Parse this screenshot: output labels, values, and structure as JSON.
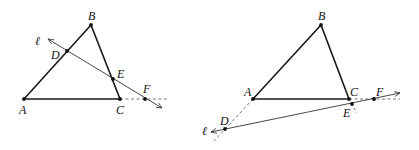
{
  "figures": [
    {
      "id": "left",
      "points": {
        "A": {
          "x": 24,
          "y": 99,
          "label": "A",
          "lx": 19,
          "ly": 114
        },
        "B": {
          "x": 91,
          "y": 25,
          "label": "B",
          "lx": 89,
          "ly": 20
        },
        "C": {
          "x": 120,
          "y": 99,
          "label": "C",
          "lx": 116,
          "ly": 114
        },
        "D": {
          "x": 67,
          "y": 51,
          "label": "D",
          "lx": 51,
          "ly": 59
        },
        "E": {
          "x": 113,
          "y": 79,
          "label": "E",
          "lx": 117,
          "ly": 78
        },
        "F": {
          "x": 145,
          "y": 99,
          "label": "F",
          "lx": 144,
          "ly": 93
        }
      },
      "line_label": {
        "text": "ℓ",
        "x": 36,
        "y": 45
      },
      "line_l": {
        "x1": 48,
        "y1": 39,
        "x2": 162,
        "y2": 108
      },
      "dashed": [
        {
          "x1": 120,
          "y1": 99,
          "x2": 167,
          "y2": 99
        }
      ]
    },
    {
      "id": "right",
      "points": {
        "A": {
          "x": 253,
          "y": 99,
          "label": "A",
          "lx": 245,
          "ly": 96
        },
        "B": {
          "x": 321,
          "y": 25,
          "label": "B",
          "lx": 319,
          "ly": 20
        },
        "C": {
          "x": 349,
          "y": 99,
          "label": "C",
          "lx": 350,
          "ly": 96
        },
        "D": {
          "x": 225,
          "y": 129,
          "label": "D",
          "lx": 220,
          "ly": 125
        },
        "E": {
          "x": 352,
          "y": 104,
          "label": "E",
          "lx": 343,
          "ly": 117
        },
        "F": {
          "x": 374,
          "y": 99,
          "label": "F",
          "lx": 376,
          "ly": 96
        },
        "Fdummy": null
      },
      "line_label": {
        "text": "ℓ",
        "x": 203,
        "y": 135
      },
      "line_l": {
        "x1": 211,
        "y1": 132,
        "x2": 400,
        "y2": 93
      },
      "dashed": [
        {
          "x1": 253,
          "y1": 99,
          "x2": 215,
          "y2": 140
        },
        {
          "x1": 349,
          "y1": 99,
          "x2": 400,
          "y2": 99
        },
        {
          "x1": 352,
          "y1": 104,
          "x2": 358,
          "y2": 113
        }
      ]
    }
  ],
  "labels": {
    "left_A": "A",
    "left_B": "B",
    "left_C": "C",
    "left_D": "D",
    "left_E": "E",
    "left_F": "F",
    "left_l": "ℓ",
    "right_A": "A",
    "right_B": "B",
    "right_C": "C",
    "right_D": "D",
    "right_E": "E",
    "right_F": "F",
    "right_l": "ℓ"
  }
}
